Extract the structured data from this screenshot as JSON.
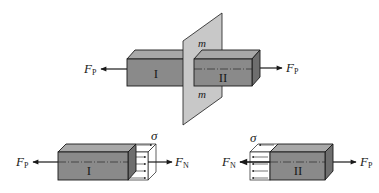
{
  "figure": {
    "top": {
      "plane_label_upper": "m",
      "plane_label_lower": "m",
      "left_part_label": "I",
      "right_part_label": "II",
      "left_force": {
        "symbol": "F",
        "subscript": "P"
      },
      "right_force": {
        "symbol": "F",
        "subscript": "P"
      }
    },
    "bottom_left": {
      "part_label": "I",
      "stress_label": "σ",
      "left_force": {
        "symbol": "F",
        "subscript": "P"
      },
      "right_force": {
        "symbol": "F",
        "subscript": "N"
      }
    },
    "bottom_right": {
      "part_label": "II",
      "stress_label": "σ",
      "left_force": {
        "symbol": "F",
        "subscript": "N"
      },
      "right_force": {
        "symbol": "F",
        "subscript": "P"
      }
    },
    "colors": {
      "box_front": "#8a8a8a",
      "box_top": "#a8a8a8",
      "box_side": "#6e6e6e",
      "plane": "#c8c8c8",
      "stroke": "#1a1a1a"
    }
  }
}
